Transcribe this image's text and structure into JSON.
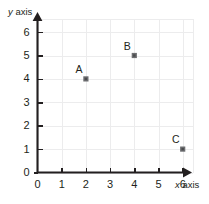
{
  "chart_data": {
    "type": "scatter",
    "title": "",
    "xlabel": "x axis",
    "ylabel": "y axis",
    "xlim": [
      0,
      6.6
    ],
    "ylim": [
      0,
      6.6
    ],
    "xticks": [
      "0",
      "1",
      "2",
      "3",
      "4",
      "5",
      "6"
    ],
    "yticks": [
      "0",
      "1",
      "2",
      "3",
      "4",
      "5",
      "6"
    ],
    "grid": true,
    "legend": "none",
    "points": [
      {
        "label": "A",
        "x": 2,
        "y": 4
      },
      {
        "label": "B",
        "x": 4,
        "y": 5
      },
      {
        "label": "C",
        "x": 6,
        "y": 1
      }
    ]
  },
  "axes": {
    "y_title_var": "y",
    "y_title_rest": " axis",
    "x_title_var": "x",
    "x_title_rest": " axis"
  },
  "colors": {
    "axis": "#231f20",
    "grid": "#ececed",
    "marker": "#6d6e71",
    "background": "#ffffff"
  }
}
